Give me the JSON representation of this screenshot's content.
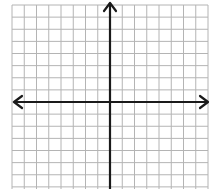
{
  "diagram": {
    "type": "coordinate-plane",
    "grid": {
      "columns": 16,
      "rows": 15,
      "line_color": "#b4b4b4",
      "background": "#ffffff"
    },
    "axes": {
      "color": "#1a1a1a",
      "x_axis": {
        "arrows": [
          "left",
          "right"
        ]
      },
      "y_axis": {
        "arrows": [
          "up"
        ]
      }
    },
    "labels": []
  }
}
